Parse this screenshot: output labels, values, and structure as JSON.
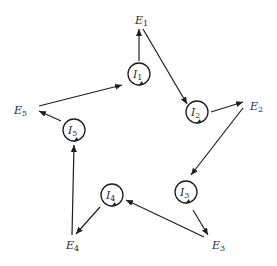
{
  "diagram": {
    "type": "star-cycle",
    "external_nodes": [
      {
        "id": "E1",
        "letter": "E",
        "sub": "1"
      },
      {
        "id": "E2",
        "letter": "E",
        "sub": "2"
      },
      {
        "id": "E3",
        "letter": "E",
        "sub": "3"
      },
      {
        "id": "E4",
        "letter": "E",
        "sub": "4"
      },
      {
        "id": "E5",
        "letter": "E",
        "sub": "5"
      }
    ],
    "internal_nodes": [
      {
        "id": "I1",
        "letter": "I",
        "sub": "1",
        "self_loop": true
      },
      {
        "id": "I2",
        "letter": "I",
        "sub": "2",
        "self_loop": true
      },
      {
        "id": "I3",
        "letter": "I",
        "sub": "3",
        "self_loop": true
      },
      {
        "id": "I4",
        "letter": "I",
        "sub": "4",
        "self_loop": true
      },
      {
        "id": "I5",
        "letter": "I",
        "sub": "5",
        "self_loop": true
      }
    ],
    "edges": [
      {
        "from": "I1",
        "to": "E1"
      },
      {
        "from": "E1",
        "to": "I2"
      },
      {
        "from": "I2",
        "to": "E2"
      },
      {
        "from": "E2",
        "to": "I3"
      },
      {
        "from": "I3",
        "to": "E3"
      },
      {
        "from": "E3",
        "to": "I4"
      },
      {
        "from": "I4",
        "to": "E4"
      },
      {
        "from": "E4",
        "to": "I5"
      },
      {
        "from": "I5",
        "to": "E5"
      },
      {
        "from": "E5",
        "to": "I1"
      }
    ],
    "colors": {
      "stroke": "#1e1e1e",
      "text": "#2a2a2a",
      "background": "#ffffff"
    }
  }
}
